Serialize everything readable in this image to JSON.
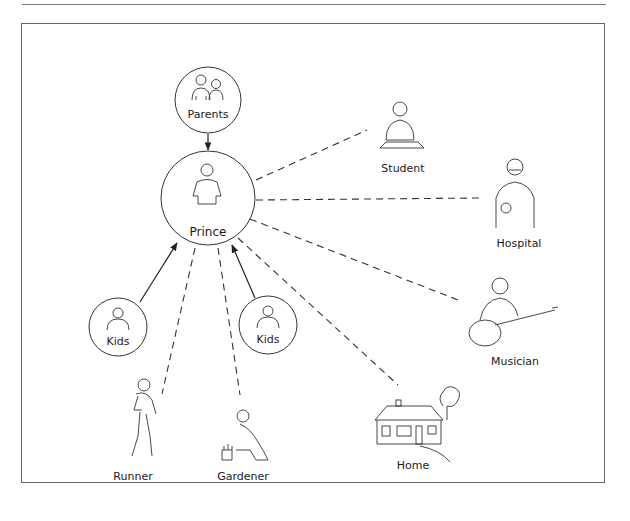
{
  "diagram": {
    "center": {
      "label": "Prince"
    },
    "family": [
      {
        "id": "parents",
        "label": "Parents",
        "relation": "solid-arrow-to-center"
      },
      {
        "id": "kids-left",
        "label": "Kids",
        "relation": "solid-arrow-to-center"
      },
      {
        "id": "kids-right",
        "label": "Kids",
        "relation": "solid-arrow-to-center"
      }
    ],
    "roles": [
      {
        "id": "student",
        "label": "Student"
      },
      {
        "id": "hospital",
        "label": "Hospital"
      },
      {
        "id": "musician",
        "label": "Musician"
      },
      {
        "id": "home",
        "label": "Home"
      },
      {
        "id": "gardener",
        "label": "Gardener"
      },
      {
        "id": "runner",
        "label": "Runner"
      }
    ],
    "colors": {
      "stroke": "#2a2a2a",
      "frame": "#666666",
      "background": "#ffffff"
    }
  }
}
